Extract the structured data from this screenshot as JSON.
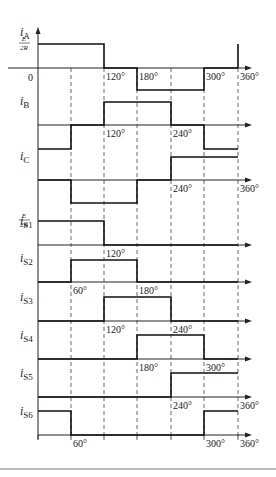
{
  "x_positions": {
    "0": 38,
    "60": 71,
    "120": 104,
    "180": 137,
    "240": 171,
    "300": 204,
    "360": 238
  },
  "axis_end_x": 252,
  "amplitude_label": {
    "num": "E",
    "den": "2R"
  },
  "origin_label": "0",
  "waveforms": [
    {
      "name": "iA",
      "sym": "i",
      "sub": "A",
      "axis_y": 68,
      "top_y": 44,
      "bot_y": 90,
      "segments": [
        [
          0,
          120,
          1
        ],
        [
          120,
          180,
          0
        ],
        [
          180,
          300,
          -1
        ],
        [
          300,
          360,
          0
        ]
      ],
      "spike_at": 360,
      "labels": [
        "120°",
        "180°",
        "300°",
        "360°"
      ],
      "label_at": [
        120,
        180,
        300,
        360
      ],
      "show_zero": true,
      "show_amp": true
    },
    {
      "name": "iB",
      "sym": "i",
      "sub": "B",
      "axis_y": 125,
      "top_y": 102,
      "bot_y": 149,
      "segments": [
        [
          0,
          60,
          -1
        ],
        [
          60,
          120,
          0
        ],
        [
          120,
          240,
          1
        ],
        [
          240,
          300,
          0
        ],
        [
          300,
          360,
          -1
        ]
      ],
      "labels": [
        "120°",
        "240°"
      ],
      "label_at": [
        120,
        240
      ]
    },
    {
      "name": "iC",
      "sym": "i",
      "sub": "C",
      "axis_y": 180,
      "top_y": 157,
      "bot_y": 203,
      "segments": [
        [
          0,
          60,
          0
        ],
        [
          60,
          180,
          -1
        ],
        [
          180,
          240,
          0
        ],
        [
          240,
          360,
          1
        ]
      ],
      "labels": [
        "240°",
        "360°"
      ],
      "label_at": [
        240,
        360
      ]
    },
    {
      "name": "iS1",
      "sym": "i",
      "sub": "S1",
      "axis_y": 245,
      "top_y": 221,
      "segments": [
        [
          0,
          120,
          1
        ],
        [
          120,
          360,
          0
        ]
      ],
      "labels": [
        "120°"
      ],
      "label_at": [
        120
      ],
      "show_amp": true
    },
    {
      "name": "iS2",
      "sym": "i",
      "sub": "S2",
      "axis_y": 282,
      "top_y": 260,
      "segments": [
        [
          0,
          60,
          0
        ],
        [
          60,
          180,
          1
        ],
        [
          180,
          360,
          0
        ]
      ],
      "labels": [
        "60°",
        "180°"
      ],
      "label_at": [
        60,
        180
      ]
    },
    {
      "name": "iS3",
      "sym": "i",
      "sub": "S3",
      "axis_y": 321,
      "top_y": 297,
      "segments": [
        [
          0,
          120,
          0
        ],
        [
          120,
          240,
          1
        ],
        [
          240,
          360,
          0
        ]
      ],
      "labels": [
        "120°",
        "240°"
      ],
      "label_at": [
        120,
        240
      ]
    },
    {
      "name": "iS4",
      "sym": "i",
      "sub": "S4",
      "axis_y": 359,
      "top_y": 335,
      "segments": [
        [
          0,
          180,
          0
        ],
        [
          180,
          300,
          1
        ],
        [
          300,
          360,
          0
        ]
      ],
      "labels": [
        "180°",
        "300°"
      ],
      "label_at": [
        180,
        300
      ]
    },
    {
      "name": "iS5",
      "sym": "i",
      "sub": "S5",
      "axis_y": 397,
      "top_y": 373,
      "segments": [
        [
          0,
          240,
          0
        ],
        [
          240,
          360,
          1
        ]
      ],
      "labels": [
        "240°",
        "360°"
      ],
      "label_at": [
        240,
        360
      ]
    },
    {
      "name": "iS6",
      "sym": "i",
      "sub": "S6",
      "axis_y": 435,
      "top_y": 411,
      "segments": [
        [
          0,
          60,
          1
        ],
        [
          60,
          300,
          0
        ],
        [
          300,
          360,
          1
        ]
      ],
      "labels": [
        "60°",
        "300°",
        "360°"
      ],
      "label_at": [
        60,
        300,
        360
      ],
      "ticks": true
    }
  ],
  "bottom_rule_y": 469
}
